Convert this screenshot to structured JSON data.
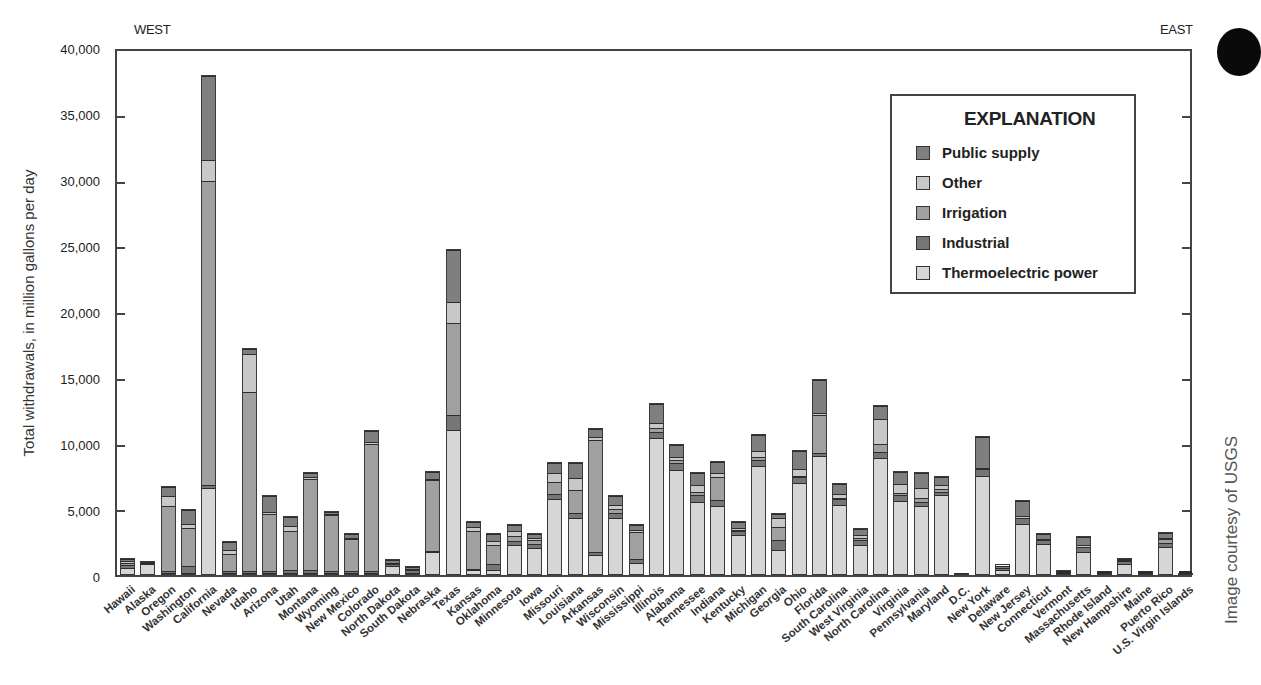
{
  "chart_data": {
    "type": "bar",
    "stacked": true,
    "title": "",
    "xlabel": "",
    "ylabel": "Total withdrawals, in million gallons per day",
    "ylim": [
      0,
      40000
    ],
    "yticks": [
      0,
      5000,
      10000,
      15000,
      20000,
      25000,
      30000,
      35000,
      40000
    ],
    "ytick_labels": [
      "0",
      "5,000",
      "10,000",
      "15,000",
      "20,000",
      "25,000",
      "30,000",
      "35,000",
      "40,000"
    ],
    "grid": false,
    "legend_position": "upper right",
    "legend_title": "EXPLANATION",
    "annotations": {
      "left": "WEST",
      "right": "EAST"
    },
    "categories": [
      "Hawaii",
      "Alaska",
      "Oregon",
      "Washington",
      "California",
      "Nevada",
      "Idaho",
      "Arizona",
      "Utah",
      "Montana",
      "Wyoming",
      "New Mexico",
      "Colorado",
      "North Dakota",
      "South Dakota",
      "Nebraska",
      "Texas",
      "Kansas",
      "Oklahoma",
      "Minnesota",
      "Iowa",
      "Missouri",
      "Louisiana",
      "Arkansas",
      "Wisconsin",
      "Mississippi",
      "Illinois",
      "Alabama",
      "Tennessee",
      "Indiana",
      "Kentucky",
      "Michigan",
      "Georgia",
      "Ohio",
      "Florida",
      "South Carolina",
      "West Virginia",
      "North Carolina",
      "Virginia",
      "Pennsylvania",
      "Maryland",
      "D.C.",
      "New York",
      "Delaware",
      "New Jersey",
      "Connecticut",
      "Vermont",
      "Massachusetts",
      "Rhode Island",
      "New Hampshire",
      "Maine",
      "Puerto Rico",
      "U.S. Virgin Islands"
    ],
    "series": [
      {
        "name": "Thermoelectric power",
        "color": "#d6d6d6",
        "values": [
          500,
          900,
          100,
          100,
          6600,
          100,
          100,
          100,
          100,
          100,
          100,
          100,
          100,
          700,
          100,
          1700,
          11000,
          300,
          300,
          2300,
          2100,
          5800,
          4300,
          1500,
          4400,
          900,
          10500,
          8000,
          5600,
          5300,
          3100,
          8300,
          1900,
          7000,
          9100,
          5400,
          2300,
          8900,
          5700,
          5300,
          6100,
          0,
          7600,
          400,
          3900,
          2400,
          200,
          1800,
          100,
          900,
          100,
          2200,
          50
        ]
      },
      {
        "name": "Industrial",
        "color": "#767676",
        "values": [
          300,
          100,
          100,
          500,
          200,
          100,
          100,
          100,
          200,
          200,
          100,
          100,
          100,
          200,
          300,
          100,
          1200,
          100,
          500,
          300,
          300,
          400,
          400,
          200,
          400,
          300,
          400,
          600,
          500,
          400,
          300,
          500,
          800,
          500,
          200,
          400,
          400,
          500,
          400,
          300,
          300,
          0,
          500,
          200,
          500,
          300,
          100,
          400,
          100,
          200,
          100,
          300,
          30
        ]
      },
      {
        "name": "Irrigation",
        "color": "#a0a0a0",
        "values": [
          200,
          0,
          5100,
          3000,
          23200,
          1400,
          13800,
          4500,
          3100,
          7100,
          4400,
          2600,
          9800,
          0,
          100,
          5500,
          7000,
          3000,
          1500,
          400,
          300,
          900,
          1800,
          8600,
          300,
          2100,
          300,
          200,
          300,
          1800,
          100,
          200,
          1000,
          100,
          2900,
          100,
          200,
          600,
          200,
          300,
          200,
          0,
          0,
          0,
          0,
          0,
          0,
          0,
          0,
          0,
          0,
          300,
          0
        ]
      },
      {
        "name": "Other",
        "color": "#c8c8c8",
        "values": [
          100,
          0,
          800,
          300,
          1600,
          300,
          2900,
          100,
          400,
          100,
          100,
          100,
          200,
          100,
          0,
          100,
          1600,
          300,
          300,
          400,
          200,
          700,
          900,
          300,
          300,
          200,
          400,
          200,
          500,
          300,
          100,
          500,
          700,
          500,
          200,
          300,
          200,
          1900,
          700,
          800,
          300,
          0,
          100,
          0,
          100,
          100,
          0,
          100,
          0,
          100,
          0,
          100,
          0
        ]
      },
      {
        "name": "Public supply",
        "color": "#7f7f7f",
        "values": [
          200,
          100,
          700,
          1100,
          6400,
          700,
          400,
          1300,
          700,
          300,
          200,
          300,
          800,
          200,
          200,
          500,
          4000,
          400,
          600,
          500,
          300,
          800,
          1200,
          600,
          700,
          400,
          1500,
          1000,
          900,
          900,
          500,
          1200,
          300,
          1400,
          2500,
          800,
          500,
          1000,
          900,
          1100,
          600,
          100,
          2400,
          200,
          1200,
          400,
          100,
          700,
          100,
          100,
          100,
          400,
          50
        ]
      }
    ]
  },
  "header": {
    "west_label": "WEST",
    "east_label": "EAST"
  },
  "legend": {
    "title": "EXPLANATION",
    "items": [
      {
        "label": "Public supply",
        "color": "#7f7f7f"
      },
      {
        "label": "Other",
        "color": "#c8c8c8"
      },
      {
        "label": "Irrigation",
        "color": "#a0a0a0"
      },
      {
        "label": "Industrial",
        "color": "#767676"
      },
      {
        "label": "Thermoelectric power",
        "color": "#d6d6d6"
      }
    ]
  },
  "credit": "Image courtesy of USGS"
}
